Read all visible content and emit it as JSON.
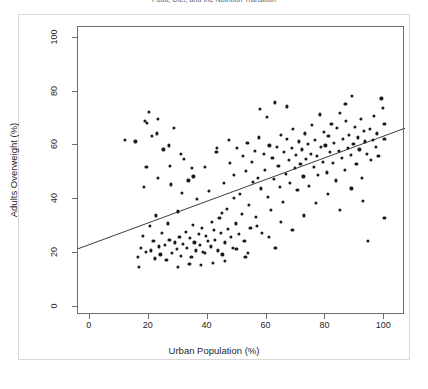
{
  "chart_data": {
    "type": "scatter",
    "title": "Food, Diet, and the Nutrition Transition",
    "xlabel": "Urban Population (%)",
    "ylabel": "Adults Overweight (%)",
    "xlim": [
      -4,
      107
    ],
    "ylim": [
      -3,
      104
    ],
    "xticks": [
      0,
      20,
      40,
      60,
      80,
      100
    ],
    "yticks": [
      0,
      20,
      40,
      60,
      80,
      100
    ],
    "grid": false,
    "legend": null,
    "point_color": "#1b1b1b",
    "line_color": "#3b3b3b",
    "trendline": {
      "label": "linear fit",
      "x": [
        -4,
        107
      ],
      "y": [
        21.6,
        66.4
      ],
      "slope": 0.404,
      "intercept": 23.2
    },
    "series": [
      {
        "name": "Countries",
        "points": [
          [
            11.8,
            62.0
          ],
          [
            15.5,
            61.5
          ],
          [
            16.2,
            18.5
          ],
          [
            16.6,
            14.8
          ],
          [
            17.3,
            22.0
          ],
          [
            18.0,
            26.5
          ],
          [
            18.4,
            44.5
          ],
          [
            19.0,
            20.5
          ],
          [
            19.4,
            68.5
          ],
          [
            20.0,
            72.5
          ],
          [
            20.5,
            30.0
          ],
          [
            20.8,
            21.0
          ],
          [
            21.2,
            63.5
          ],
          [
            21.6,
            24.5
          ],
          [
            22.0,
            18.0
          ],
          [
            22.4,
            34.0
          ],
          [
            23.0,
            70.0
          ],
          [
            23.5,
            22.5
          ],
          [
            24.0,
            19.5
          ],
          [
            24.5,
            27.5
          ],
          [
            25.0,
            58.5
          ],
          [
            25.4,
            23.0
          ],
          [
            26.0,
            17.5
          ],
          [
            26.5,
            31.0
          ],
          [
            27.0,
            25.0
          ],
          [
            27.5,
            45.5
          ],
          [
            28.0,
            20.0
          ],
          [
            28.6,
            66.5
          ],
          [
            29.0,
            24.0
          ],
          [
            29.5,
            21.5
          ],
          [
            30.0,
            35.5
          ],
          [
            30.4,
            26.0
          ],
          [
            31.0,
            19.0
          ],
          [
            31.5,
            23.5
          ],
          [
            32.0,
            55.0
          ],
          [
            32.5,
            28.0
          ],
          [
            33.0,
            22.0
          ],
          [
            33.5,
            47.0
          ],
          [
            34.0,
            25.5
          ],
          [
            34.5,
            18.5
          ],
          [
            35.0,
            30.5
          ],
          [
            35.5,
            24.0
          ],
          [
            36.0,
            21.0
          ],
          [
            36.5,
            40.0
          ],
          [
            37.0,
            27.0
          ],
          [
            37.5,
            23.0
          ],
          [
            38.0,
            29.5
          ],
          [
            38.5,
            20.5
          ],
          [
            39.0,
            52.0
          ],
          [
            39.5,
            26.5
          ],
          [
            40.0,
            24.5
          ],
          [
            40.5,
            43.0
          ],
          [
            41.0,
            22.5
          ],
          [
            41.5,
            31.5
          ],
          [
            42.0,
            28.5
          ],
          [
            42.5,
            25.0
          ],
          [
            43.0,
            57.5
          ],
          [
            43.5,
            21.0
          ],
          [
            44.0,
            33.0
          ],
          [
            44.5,
            27.5
          ],
          [
            45.0,
            19.5
          ],
          [
            45.5,
            46.0
          ],
          [
            46.0,
            24.0
          ],
          [
            46.5,
            36.5
          ],
          [
            47.0,
            29.0
          ],
          [
            47.5,
            53.5
          ],
          [
            48.0,
            26.0
          ],
          [
            48.5,
            22.0
          ],
          [
            49.0,
            49.0
          ],
          [
            49.5,
            31.0
          ],
          [
            50.0,
            59.0
          ],
          [
            50.5,
            27.0
          ],
          [
            51.0,
            42.0
          ],
          [
            51.5,
            34.5
          ],
          [
            52.0,
            56.0
          ],
          [
            52.5,
            24.5
          ],
          [
            53.0,
            50.5
          ],
          [
            53.5,
            61.0
          ],
          [
            54.0,
            38.0
          ],
          [
            54.5,
            29.5
          ],
          [
            55.0,
            54.0
          ],
          [
            55.5,
            46.5
          ],
          [
            56.0,
            58.0
          ],
          [
            56.5,
            33.5
          ],
          [
            57.0,
            48.0
          ],
          [
            57.5,
            63.0
          ],
          [
            58.0,
            44.0
          ],
          [
            58.5,
            27.5
          ],
          [
            59.0,
            57.0
          ],
          [
            59.5,
            51.0
          ],
          [
            60.0,
            70.5
          ],
          [
            60.5,
            41.0
          ],
          [
            61.0,
            60.0
          ],
          [
            61.5,
            36.0
          ],
          [
            62.0,
            55.5
          ],
          [
            62.5,
            47.5
          ],
          [
            63.0,
            22.0
          ],
          [
            63.5,
            59.5
          ],
          [
            64.0,
            52.5
          ],
          [
            64.5,
            44.5
          ],
          [
            65.0,
            64.0
          ],
          [
            65.5,
            39.0
          ],
          [
            66.0,
            57.5
          ],
          [
            66.5,
            49.5
          ],
          [
            67.0,
            62.5
          ],
          [
            67.5,
            54.5
          ],
          [
            68.0,
            46.0
          ],
          [
            68.5,
            59.0
          ],
          [
            69.0,
            66.0
          ],
          [
            69.5,
            51.5
          ],
          [
            70.0,
            56.5
          ],
          [
            70.5,
            43.5
          ],
          [
            71.0,
            61.5
          ],
          [
            71.5,
            53.0
          ],
          [
            72.0,
            58.5
          ],
          [
            72.5,
            48.5
          ],
          [
            73.0,
            64.5
          ],
          [
            73.5,
            55.0
          ],
          [
            74.0,
            60.5
          ],
          [
            74.5,
            45.0
          ],
          [
            75.0,
            57.0
          ],
          [
            75.5,
            67.5
          ],
          [
            76.0,
            52.0
          ],
          [
            76.5,
            62.0
          ],
          [
            77.0,
            56.0
          ],
          [
            77.5,
            49.0
          ],
          [
            78.0,
            71.5
          ],
          [
            78.5,
            59.5
          ],
          [
            79.0,
            54.0
          ],
          [
            79.5,
            65.0
          ],
          [
            80.0,
            60.0
          ],
          [
            80.5,
            50.0
          ],
          [
            81.0,
            63.5
          ],
          [
            81.5,
            57.5
          ],
          [
            82.0,
            68.0
          ],
          [
            82.5,
            53.5
          ],
          [
            83.0,
            61.0
          ],
          [
            83.5,
            47.0
          ],
          [
            84.0,
            66.5
          ],
          [
            84.5,
            58.0
          ],
          [
            85.0,
            72.0
          ],
          [
            85.5,
            55.5
          ],
          [
            86.0,
            62.5
          ],
          [
            86.5,
            51.0
          ],
          [
            87.0,
            69.0
          ],
          [
            87.5,
            59.0
          ],
          [
            88.0,
            64.0
          ],
          [
            88.5,
            56.5
          ],
          [
            89.0,
            78.5
          ],
          [
            89.5,
            60.5
          ],
          [
            90.0,
            67.0
          ],
          [
            90.5,
            53.0
          ],
          [
            91.0,
            63.0
          ],
          [
            91.5,
            58.5
          ],
          [
            92.0,
            70.0
          ],
          [
            92.5,
            48.0
          ],
          [
            93.0,
            65.5
          ],
          [
            93.5,
            61.5
          ],
          [
            94.0,
            57.0
          ],
          [
            94.5,
            24.5
          ],
          [
            95.0,
            66.0
          ],
          [
            95.5,
            54.5
          ],
          [
            96.0,
            62.0
          ],
          [
            96.5,
            71.0
          ],
          [
            97.0,
            59.5
          ],
          [
            97.5,
            64.5
          ],
          [
            98.0,
            56.0
          ],
          [
            99.0,
            77.5
          ],
          [
            99.5,
            74.0
          ],
          [
            100.0,
            33.0
          ],
          [
            100.0,
            62.5
          ],
          [
            100.0,
            68.0
          ],
          [
            18.8,
            69.0
          ],
          [
            22.8,
            64.5
          ],
          [
            26.8,
            60.0
          ],
          [
            30.8,
            57.0
          ],
          [
            34.8,
            51.5
          ],
          [
            44.8,
            35.0
          ],
          [
            48.8,
            40.5
          ],
          [
            56.8,
            30.0
          ],
          [
            60.8,
            26.0
          ],
          [
            64.8,
            31.5
          ],
          [
            68.8,
            28.5
          ],
          [
            72.8,
            34.0
          ],
          [
            76.8,
            38.5
          ],
          [
            80.8,
            42.0
          ],
          [
            84.8,
            36.0
          ],
          [
            88.8,
            44.0
          ],
          [
            92.8,
            39.5
          ],
          [
            52.8,
            18.5
          ],
          [
            57.8,
            73.5
          ],
          [
            62.8,
            76.0
          ],
          [
            66.8,
            74.5
          ],
          [
            86.8,
            75.5
          ],
          [
            41.8,
            16.5
          ],
          [
            37.8,
            15.5
          ],
          [
            33.8,
            16.0
          ],
          [
            29.8,
            15.0
          ],
          [
            45.8,
            17.0
          ],
          [
            49.8,
            21.5
          ],
          [
            53.8,
            20.0
          ],
          [
            35.2,
            48.5
          ],
          [
            31.2,
            42.5
          ],
          [
            43.2,
            59.0
          ],
          [
            47.2,
            62.0
          ],
          [
            39.2,
            20.0
          ],
          [
            23.2,
            48.0
          ],
          [
            27.2,
            52.5
          ],
          [
            19.2,
            52.0
          ]
        ]
      }
    ]
  },
  "axis": {
    "x_tick_labels": [
      "0",
      "20",
      "40",
      "60",
      "80",
      "100"
    ],
    "y_tick_labels": [
      "0",
      "20",
      "40",
      "60",
      "80",
      "100"
    ]
  }
}
